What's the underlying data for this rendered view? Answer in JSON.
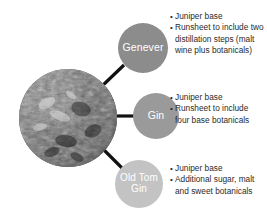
{
  "diagram": {
    "type": "radial-callout",
    "background_color": "#ffffff",
    "center_image": {
      "name": "juniper-botanicals-photo",
      "description": "Grayscale close-up photo of juniper berries and botanicals",
      "shape": "circle"
    },
    "line_color": "#111111",
    "nodes": [
      {
        "id": "genever",
        "label": "Genever",
        "color": "#8c8c8c",
        "text_color": "#ffffff",
        "bullets": [
          "Juniper base",
          "Runsheet to include two distillation steps (malt wine plus botanicals)"
        ]
      },
      {
        "id": "gin",
        "label": "Gin",
        "color": "#9a9a9a",
        "text_color": "#ffffff",
        "bullets": [
          "Juniper base",
          "Runsheet to include four base botanicals"
        ]
      },
      {
        "id": "old-tom-gin",
        "label": "Old Tom Gin",
        "label_line_1": "Old Tom",
        "label_line_2": "Gin",
        "color": "#c3c3c3",
        "text_color": "#ffffff",
        "bullets": [
          "Juniper base",
          "Additional sugar, malt and sweet botanicals"
        ]
      }
    ]
  }
}
